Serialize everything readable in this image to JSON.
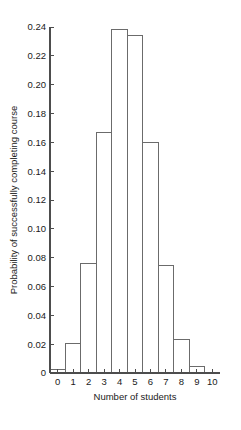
{
  "chart_data": {
    "type": "bar",
    "title": "",
    "xlabel": "Number of students",
    "ylabel": "Probability of successfully completing course",
    "categories": [
      "0",
      "1",
      "2",
      "3",
      "4",
      "5",
      "6",
      "7",
      "8",
      "9",
      "10"
    ],
    "values": [
      0.0025,
      0.0207,
      0.0763,
      0.1665,
      0.2384,
      0.234,
      0.1596,
      0.0746,
      0.0229,
      0.0042,
      0.0
    ],
    "xlim": [
      -0.5,
      10.5
    ],
    "ylim": [
      0,
      0.24
    ],
    "xticks": [
      "0",
      "1",
      "2",
      "3",
      "4",
      "5",
      "6",
      "7",
      "8",
      "9",
      "10"
    ],
    "xtick_values": [
      0,
      1,
      2,
      3,
      4,
      5,
      6,
      7,
      8,
      9,
      10
    ],
    "yticks": [
      "0",
      "0.02",
      "0.04",
      "0.06",
      "0.08",
      "0.10",
      "0.12",
      "0.14",
      "0.16",
      "0.18",
      "0.20",
      "0.22",
      "0.24"
    ],
    "ytick_values": [
      0,
      0.02,
      0.04,
      0.06,
      0.08,
      0.1,
      0.12,
      0.14,
      0.16,
      0.18,
      0.2,
      0.22,
      0.24
    ],
    "grid": false,
    "legend": null,
    "bar_style": {
      "fill": "#ffffff",
      "edge": "#6b6b6b",
      "bar_width": 1.0
    },
    "axis_color": "#4d4d4d",
    "background": "#ffffff",
    "spines": [
      "left",
      "bottom"
    ]
  },
  "geometry": {
    "plot_left": 50,
    "plot_right": 220,
    "plot_top": 27,
    "plot_bottom": 373,
    "tick_len": 4
  }
}
